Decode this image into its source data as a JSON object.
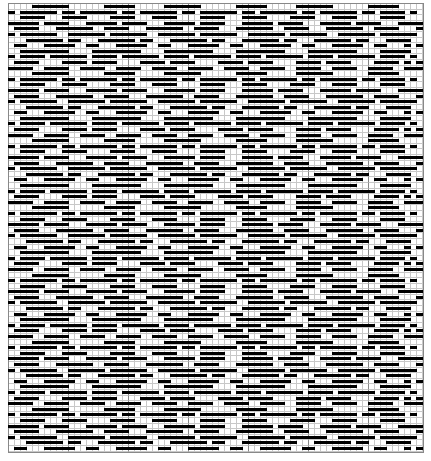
{
  "pattern": {
    "title": "",
    "columns": 69,
    "rows": 80,
    "cell_on_color": "#000000",
    "grid_line_color": "#c8c8c8",
    "major_line_color": "#888888",
    "motif_rows": [
      "0000111111000000111110000011111100000011111000001111110000001111100",
      "1011111101101111110110111111011011111101101111110110111111011011110",
      "0011110001111000011110001111000011110001111000011110001111000011110",
      "1111101111000111110111100011111011110001111101111000111110111100011",
      "0111100011111100111100011111100111100011111100111100011111100111100",
      "1011111100111111011111100111111011111100111111011111100111111011111",
      "0001111110110001111110110001111110110001111110110001111110110001111",
      "0110001111100110001111100110001111100110001111100110001111100110001",
      "0011111111000011111111000011111111000011111111000011111111000011111",
      "1011110111111011110111111011110111111011110111111011110111111011110",
      "0111100001111011110000111101111000011110111100001111011110000111101",
      "1111001111001111001111001111001111001111001111001111001111001111001"
    ]
  }
}
